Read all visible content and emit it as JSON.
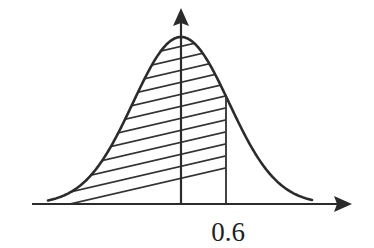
{
  "figure": {
    "kind": "normal-distribution-shaded-area",
    "background_color": "#ffffff",
    "ink_color": "#2b2b2b",
    "width": 374,
    "height": 248,
    "x_axis": {
      "name": "horizontal-axis",
      "y": 204,
      "start_x": 32,
      "end_x": 352,
      "has_arrow_head": true,
      "arrow_direction": "right",
      "label": ""
    },
    "y_axis": {
      "name": "vertical-axis",
      "x": 181,
      "top_y": 8,
      "bottom_y": 204,
      "has_arrow_head": true,
      "arrow_direction": "up",
      "label": ""
    },
    "tick_labels": [
      {
        "name": "x-tick-0.6",
        "text": "0.6",
        "x": 228,
        "y": 219,
        "axis": "x"
      }
    ],
    "boundary_line": {
      "name": "cutoff-line-at-0.6",
      "x": 226,
      "top_y": 112,
      "bottom_y": 204,
      "value": "0.6"
    },
    "shaded_region": {
      "name": "hatched-area-left-of-0.6",
      "fill_style": "diagonal-hatching",
      "hatch_count": 14,
      "hatch_spacing_px": 12,
      "hatch_angle_deg": -13,
      "from_x": 48,
      "to_x": 226,
      "meaning": "cumulative probability up to 0.6"
    }
  },
  "chart_data": {
    "type": "line",
    "title": "",
    "subtitle": "",
    "xlabel": "",
    "ylabel": "",
    "grid": false,
    "legend": "none",
    "annotations": [
      "0.6"
    ],
    "curve": {
      "name": "normal density curve",
      "mean": 0.6,
      "peak_pixel_x": 181,
      "peak_pixel_y": 37,
      "baseline_pixel_y": 204,
      "left_tail_pixel_x": 48,
      "right_tail_pixel_x": 312,
      "sigma_pixels": 48
    },
    "shaded_area": {
      "name": "area under curve left of cutoff",
      "cutoff_label": "0.6",
      "cutoff_pixel_x": 226,
      "side": "left"
    },
    "x": [
      48,
      62,
      76,
      90,
      104,
      118,
      132,
      146,
      160,
      174,
      181,
      188,
      202,
      216,
      226,
      230,
      244,
      258,
      272,
      286,
      300,
      312
    ],
    "y": [
      203,
      201,
      198,
      191,
      180,
      163,
      140,
      113,
      84,
      55,
      37,
      44,
      72,
      99,
      112,
      121,
      152,
      175,
      190,
      198,
      202,
      203
    ]
  }
}
